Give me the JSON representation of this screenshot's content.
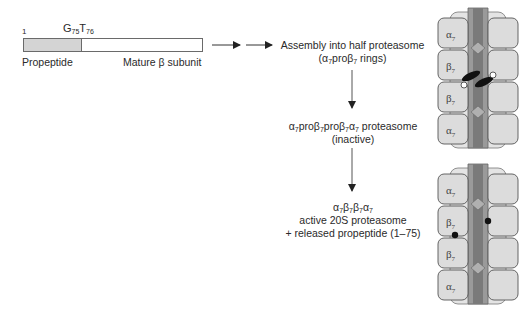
{
  "precursor": {
    "residue_start": "1",
    "cleavage_site": {
      "g": "G",
      "g_pos": "75",
      "t": "T",
      "t_pos": "76"
    },
    "propeptide_label": "Propeptide",
    "mature_label": "Mature β subunit"
  },
  "steps": [
    {
      "line1": "Assembly into half proteasome",
      "line2_pre": "(α",
      "line2_sub1": "7",
      "line2_mid": "proβ",
      "line2_sub2": "7",
      "line2_post": " rings)"
    },
    {
      "line1_parts": [
        "α",
        "7",
        "proβ",
        "7",
        "proβ",
        "7",
        "α",
        "7"
      ],
      "line1_suffix": " proteasome",
      "line2": "(inactive)"
    },
    {
      "line1_parts": [
        "α",
        "7",
        "β",
        "7",
        "β",
        "7",
        "α",
        "7"
      ],
      "line2": "active 20S proteasome",
      "line3": "+ released propeptide (1–75)"
    }
  ],
  "proteasomes": {
    "top": {
      "rings": [
        {
          "name": "α",
          "sub": "7"
        },
        {
          "name": "β",
          "sub": "7"
        },
        {
          "name": "β",
          "sub": "7"
        },
        {
          "name": "α",
          "sub": "7"
        }
      ],
      "state": "inactive-with-propeptides"
    },
    "bottom": {
      "rings": [
        {
          "name": "α",
          "sub": "7"
        },
        {
          "name": "β",
          "sub": "7"
        },
        {
          "name": "β",
          "sub": "7"
        },
        {
          "name": "α",
          "sub": "7"
        }
      ],
      "state": "active"
    }
  },
  "colors": {
    "subunit_fill": "#dcdcdc",
    "channel": "#8a8a8a",
    "outline": "#555555",
    "propeptide": "#d4d4d4"
  }
}
